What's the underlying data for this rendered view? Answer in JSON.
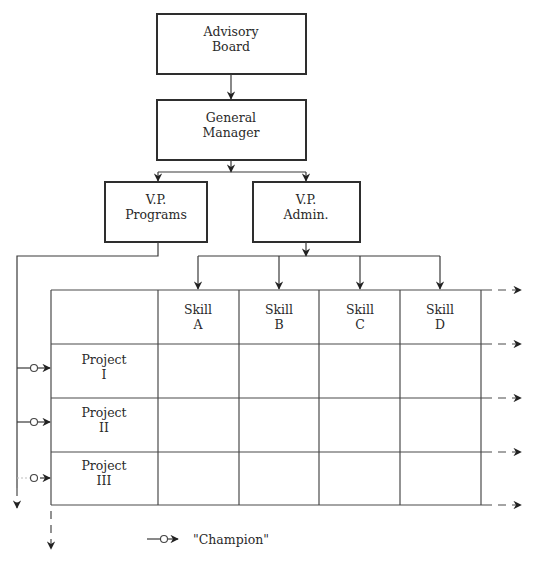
{
  "diagram": {
    "type": "matrix-organization-chart",
    "nodes": {
      "advisory_board": {
        "line1": "Advisory",
        "line2": "Board"
      },
      "general_manager": {
        "line1": "General",
        "line2": "Manager"
      },
      "vp_programs": {
        "line1": "V.P.",
        "line2": "Programs"
      },
      "vp_admin": {
        "line1": "V.P.",
        "line2": "Admin."
      }
    },
    "matrix": {
      "columns": [
        {
          "line1": "Skill",
          "line2": "A"
        },
        {
          "line1": "Skill",
          "line2": "B"
        },
        {
          "line1": "Skill",
          "line2": "C"
        },
        {
          "line1": "Skill",
          "line2": "D"
        }
      ],
      "rows": [
        {
          "line1": "Project",
          "line2": "I"
        },
        {
          "line1": "Project",
          "line2": "II"
        },
        {
          "line1": "Project",
          "line2": "III"
        }
      ]
    },
    "legend": {
      "symbol": "champion-arrow",
      "label": "\"Champion\""
    },
    "colors": {
      "line": "#3a3a3a",
      "text": "#2a2a2a",
      "background": "#ffffff"
    }
  }
}
